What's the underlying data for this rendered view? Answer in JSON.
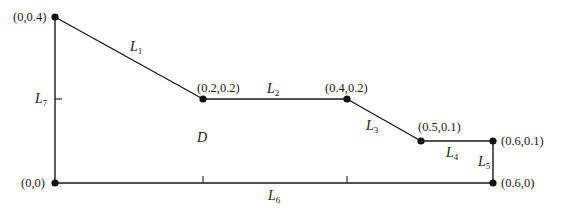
{
  "diagram": {
    "region_label": "D",
    "vertices": [
      {
        "id": "v_0_04",
        "label": "(0,0.4)",
        "x": 55,
        "y": 17
      },
      {
        "id": "v_02_02",
        "label": "(0.2,0.2)",
        "x": 203,
        "y": 99
      },
      {
        "id": "v_04_02",
        "label": "(0.4,0.2)",
        "x": 347,
        "y": 99
      },
      {
        "id": "v_05_01",
        "label": "(0.5,0.1)",
        "x": 421,
        "y": 141
      },
      {
        "id": "v_06_01",
        "label": "(0.6,0.1)",
        "x": 493,
        "y": 141
      },
      {
        "id": "v_06_0",
        "label": "(0.6,0)",
        "x": 493,
        "y": 183
      },
      {
        "id": "v_0_0",
        "label": "(0,0)",
        "x": 55,
        "y": 183
      }
    ],
    "edges": [
      {
        "name": "L",
        "sub": "1",
        "from": "(0,0.4)",
        "to": "(0.2,0.2)"
      },
      {
        "name": "L",
        "sub": "2",
        "from": "(0.2,0.2)",
        "to": "(0.4,0.2)"
      },
      {
        "name": "L",
        "sub": "3",
        "from": "(0.4,0.2)",
        "to": "(0.5,0.1)"
      },
      {
        "name": "L",
        "sub": "4",
        "from": "(0.5,0.1)",
        "to": "(0.6,0.1)"
      },
      {
        "name": "L",
        "sub": "5",
        "from": "(0.6,0.1)",
        "to": "(0.6,0)"
      },
      {
        "name": "L",
        "sub": "6",
        "from": "(0.6,0)",
        "to": "(0,0)"
      },
      {
        "name": "L",
        "sub": "7",
        "from": "(0,0)",
        "to": "(0,0.4)"
      }
    ]
  }
}
